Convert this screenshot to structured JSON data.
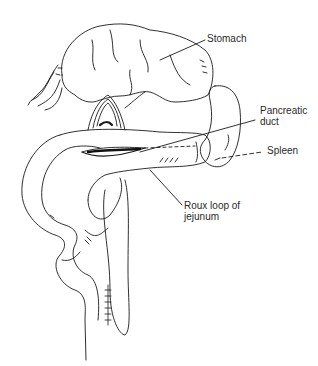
{
  "figure": {
    "labels": {
      "stomach": "Stomach",
      "pancreatic_duct_line1": "Pancreatic",
      "pancreatic_duct_line2": "duct",
      "spleen": "Spleen",
      "roux_line1": "Roux loop of",
      "roux_line2": "jejunum"
    }
  }
}
